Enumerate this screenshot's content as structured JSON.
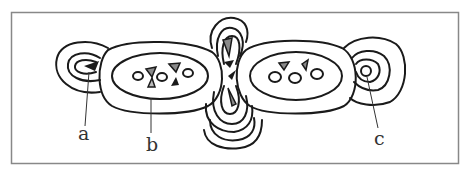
{
  "figure": {
    "frame_color": "#888888",
    "stroke_color": "#1a1a1a",
    "triangle_dark": "#1a1a1a",
    "triangle_gray": "#8a8a8a",
    "labels": {
      "a": "a",
      "b": "b",
      "c": "c"
    },
    "regions": [
      {
        "id": "a",
        "description": "left concentric lobe with dark triangle"
      },
      {
        "id": "b",
        "description": "left oval with circles and triangles"
      },
      {
        "id": "center",
        "description": "central vertical lobes with triangles"
      },
      {
        "id": "right-oval",
        "description": "right oval with circles and two triangles"
      },
      {
        "id": "c",
        "description": "right concentric rings with small circle"
      }
    ]
  }
}
